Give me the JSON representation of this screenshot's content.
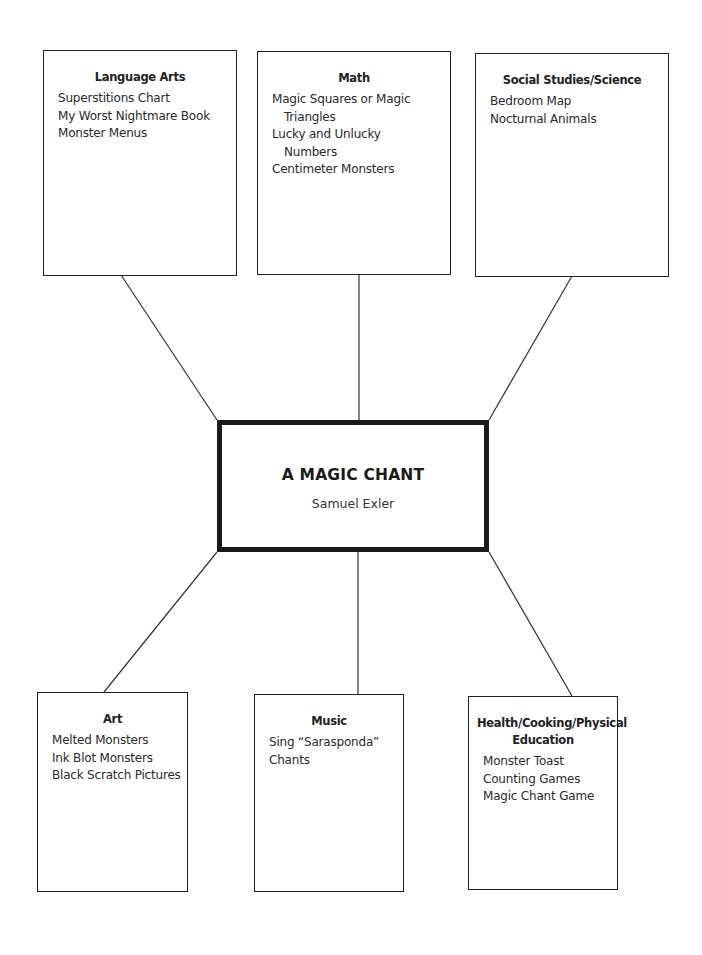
{
  "center": {
    "title": "A MAGIC CHANT",
    "subtitle": "Samuel Exler"
  },
  "branches": [
    {
      "title": "Language Arts",
      "items": [
        [
          "Superstitions Chart"
        ],
        [
          "My Worst Nightmare Book"
        ],
        [
          "Monster Menus"
        ]
      ]
    },
    {
      "title": "Math",
      "items": [
        [
          "Magic Squares or Magic",
          "Triangles"
        ],
        [
          "Lucky and Unlucky",
          "Numbers"
        ],
        [
          "Centimeter Monsters"
        ]
      ]
    },
    {
      "title": "Social Studies/Science",
      "items": [
        [
          "Bedroom Map"
        ],
        [
          "Nocturnal Animals"
        ]
      ]
    },
    {
      "title": "Art",
      "items": [
        [
          "Melted Monsters"
        ],
        [
          "Ink Blot Monsters"
        ],
        [
          "Black Scratch Pictures"
        ]
      ]
    },
    {
      "title": "Music",
      "items": [
        [
          "Sing “Sarasponda”"
        ],
        [
          "Chants"
        ]
      ]
    },
    {
      "title": "Health/Cooking/Physical Education",
      "items": [
        [
          "Monster Toast"
        ],
        [
          "Counting Games"
        ],
        [
          "Magic Chant Game"
        ]
      ]
    }
  ]
}
